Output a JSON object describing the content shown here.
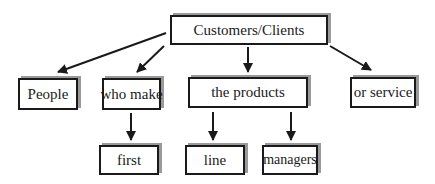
{
  "diagram": {
    "type": "hierarchy",
    "nodes": [
      {
        "id": "root",
        "label": "Customers/Clients",
        "level": 0
      },
      {
        "id": "people",
        "label": "People",
        "level": 1
      },
      {
        "id": "who_make",
        "label": "who make",
        "level": 1
      },
      {
        "id": "the_products",
        "label": "the products",
        "level": 1
      },
      {
        "id": "or_service",
        "label": "or service",
        "level": 1
      },
      {
        "id": "first",
        "label": "first",
        "level": 2
      },
      {
        "id": "line",
        "label": "line",
        "level": 2
      },
      {
        "id": "managers",
        "label": "managers",
        "level": 2
      }
    ],
    "edges": [
      {
        "from": "root",
        "to": "people"
      },
      {
        "from": "root",
        "to": "who_make"
      },
      {
        "from": "root",
        "to": "the_products"
      },
      {
        "from": "root",
        "to": "or_service"
      },
      {
        "from": "who_make",
        "to": "first"
      },
      {
        "from": "the_products",
        "to": "line"
      },
      {
        "from": "the_products",
        "to": "managers"
      }
    ],
    "colors": {
      "stroke": "#1a1a1a",
      "shadow": "#9a9a9a",
      "background": "#ffffff"
    }
  },
  "labels": {
    "root": "Customers/Clients",
    "people": "People",
    "who_make": "who make",
    "the_products": "the products",
    "or_service": "or service",
    "first": "first",
    "line": "line",
    "managers": "managers"
  }
}
